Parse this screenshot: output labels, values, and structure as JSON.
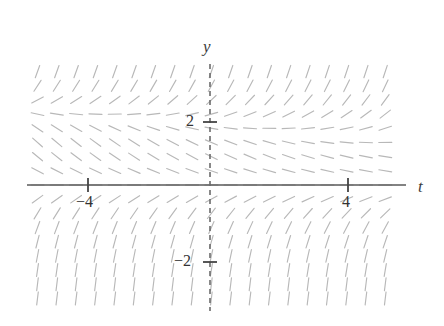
{
  "figure": {
    "kind": "slope-field",
    "background": "#ffffff",
    "width": 444,
    "height": 326
  },
  "axes": {
    "x_axis": {
      "name": "t",
      "label": "t",
      "style": "solid",
      "color": "#5a5a5a",
      "pixel_y": 185,
      "pixel_x_start": 27,
      "pixel_x_end": 406
    },
    "y_axis": {
      "name": "y",
      "label": "y",
      "style": "dashed",
      "color": "#6b6b6b",
      "pixel_x": 210,
      "pixel_y_start": 64,
      "pixel_y_end": 311
    },
    "origin_px": [
      210,
      185
    ],
    "px_per_unit_x": 34.5,
    "px_per_unit_y": 31.5
  },
  "ticks": {
    "x": [
      {
        "value": -4,
        "label": "−4",
        "pixel_x": 88
      },
      {
        "value": 4,
        "label": "4",
        "pixel_x": 348
      }
    ],
    "y": [
      {
        "value": 2,
        "label": "2",
        "pixel_y": 122
      },
      {
        "value": -2,
        "label": "−2",
        "pixel_y": 262
      }
    ],
    "tick_color": "#444444",
    "tick_half_length": 7
  },
  "chart_data": {
    "type": "scatter",
    "subtype": "slope-field",
    "title": "",
    "xlabel": "t",
    "ylabel": "y",
    "xlim": [
      -5.3,
      5.7
    ],
    "ylim": [
      -3.8,
      3.8
    ],
    "grid": false,
    "legend": null,
    "segment_color": "#b8b8b8",
    "segment_length_px": 13,
    "equilibria_y": [
      0,
      2
    ],
    "lattice": {
      "t_min": -5.0,
      "t_max": 5.4,
      "t_step": 0.56,
      "y_min": -3.6,
      "y_max": 3.6,
      "y_step": 0.45
    }
  },
  "labels": {
    "y_axis": "y",
    "t_axis": "t",
    "y_two": "2",
    "y_minus_two": "−2",
    "x_four": "4",
    "x_minus_four": "−4"
  }
}
